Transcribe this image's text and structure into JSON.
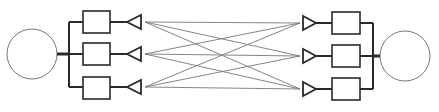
{
  "diagram": {
    "colors": {
      "stroke": "#2a2a2a",
      "light": "#777777",
      "bg": "#ffffff"
    },
    "transmitter": {
      "label": "Transmitter",
      "circle": {
        "cx": 32,
        "cy": 54,
        "r": 25
      },
      "bus_x": 69,
      "branches": [
        {
          "label": "Tx branch 1",
          "y": 22,
          "box": {
            "x": 83,
            "y": 11,
            "w": 27,
            "h": 22
          },
          "antenna_tip_x": 127,
          "antenna_base_x": 141
        },
        {
          "label": "Tx branch 2",
          "y": 54,
          "box": {
            "x": 83,
            "y": 43,
            "w": 27,
            "h": 22
          },
          "antenna_tip_x": 127,
          "antenna_base_x": 141
        },
        {
          "label": "Tx branch 3",
          "y": 87,
          "box": {
            "x": 83,
            "y": 77,
            "w": 27,
            "h": 22
          },
          "antenna_tip_x": 127,
          "antenna_base_x": 141
        }
      ]
    },
    "receiver": {
      "label": "Receiver",
      "circle": {
        "cx": 405,
        "cy": 56,
        "r": 25
      },
      "bus_x": 373,
      "branches": [
        {
          "label": "Rx branch 1",
          "y": 23,
          "box": {
            "x": 332,
            "y": 12,
            "w": 28,
            "h": 22
          },
          "antenna_base_x": 303,
          "antenna_tip_x": 316
        },
        {
          "label": "Rx branch 2",
          "y": 56,
          "box": {
            "x": 332,
            "y": 45,
            "w": 28,
            "h": 22
          },
          "antenna_base_x": 303,
          "antenna_tip_x": 316
        },
        {
          "label": "Rx branch 3",
          "y": 89,
          "box": {
            "x": 332,
            "y": 78,
            "w": 28,
            "h": 22
          },
          "antenna_base_x": 303,
          "antenna_tip_x": 316
        }
      ]
    },
    "channel_paths": {
      "from_x": 145,
      "to_x": 300,
      "count": 9
    }
  }
}
